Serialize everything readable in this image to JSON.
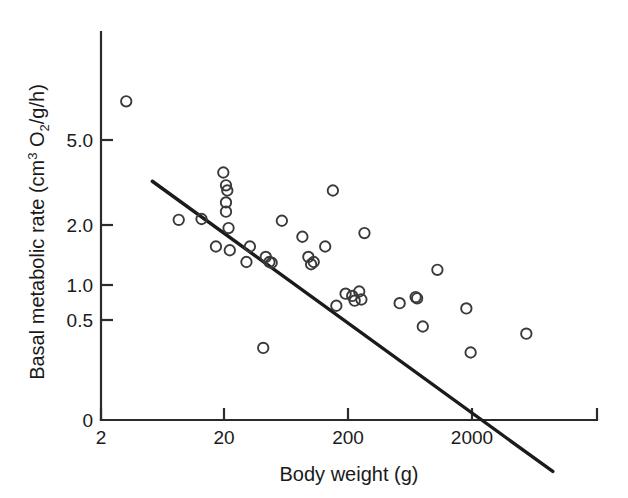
{
  "chart_data": {
    "type": "scatter",
    "title": "",
    "xlabel": "Body weight (g)",
    "ylabel_parts": {
      "prefix": "Basal metabolic rate (cm",
      "superscript": "3",
      "middle": " O",
      "subscript": "2",
      "suffix": "/g/h)"
    },
    "ylabel": "Basal metabolic rate (cm3 O2/g/h)",
    "xscale": "log",
    "yscale": "log",
    "xlim": [
      2,
      20000
    ],
    "ylim": [
      0.25,
      10
    ],
    "xticks": [
      2,
      20,
      200,
      2000
    ],
    "xtick_labels": [
      "2",
      "20",
      "200",
      "2000"
    ],
    "yticks": [
      5.0,
      2.0,
      1.0,
      0.5,
      0
    ],
    "ytick_labels": [
      "5.0",
      "2.0",
      "1.0",
      "0.5",
      "0"
    ],
    "grid": false,
    "legend": "none",
    "marker": "open-circle",
    "point_color": "#3a3a3a",
    "line_color": "#1b1b1b",
    "points": [
      {
        "x": 3.2,
        "y": 8.2
      },
      {
        "x": 8.5,
        "y": 1.8
      },
      {
        "x": 13.0,
        "y": 1.82
      },
      {
        "x": 19.5,
        "y": 3.3
      },
      {
        "x": 20.5,
        "y": 2.8
      },
      {
        "x": 21.0,
        "y": 2.62
      },
      {
        "x": 20.5,
        "y": 2.25
      },
      {
        "x": 20.5,
        "y": 2.0
      },
      {
        "x": 21.5,
        "y": 1.62
      },
      {
        "x": 17.0,
        "y": 1.28
      },
      {
        "x": 22.0,
        "y": 1.22
      },
      {
        "x": 32.0,
        "y": 1.28
      },
      {
        "x": 30.0,
        "y": 1.05
      },
      {
        "x": 43.0,
        "y": 1.12
      },
      {
        "x": 46.0,
        "y": 1.05
      },
      {
        "x": 48.0,
        "y": 1.04
      },
      {
        "x": 41.0,
        "y": 0.35
      },
      {
        "x": 58.0,
        "y": 1.78
      },
      {
        "x": 85.0,
        "y": 1.45
      },
      {
        "x": 95.0,
        "y": 1.12
      },
      {
        "x": 100.0,
        "y": 1.02
      },
      {
        "x": 105.0,
        "y": 1.05
      },
      {
        "x": 130.0,
        "y": 1.28
      },
      {
        "x": 150.0,
        "y": 2.62
      },
      {
        "x": 160.0,
        "y": 0.6
      },
      {
        "x": 190.0,
        "y": 0.7
      },
      {
        "x": 215.0,
        "y": 0.68
      },
      {
        "x": 225.0,
        "y": 0.64
      },
      {
        "x": 245.0,
        "y": 0.72
      },
      {
        "x": 255.0,
        "y": 0.65
      },
      {
        "x": 270.0,
        "y": 1.52
      },
      {
        "x": 520.0,
        "y": 0.62
      },
      {
        "x": 700.0,
        "y": 0.67
      },
      {
        "x": 720.0,
        "y": 0.66
      },
      {
        "x": 800.0,
        "y": 0.46
      },
      {
        "x": 1050.0,
        "y": 0.95
      },
      {
        "x": 1800.0,
        "y": 0.58
      },
      {
        "x": 1950.0,
        "y": 0.33
      },
      {
        "x": 5500.0,
        "y": 0.42
      }
    ],
    "fit_line": {
      "type": "linear-on-log-log",
      "x_start": 5.2,
      "y_start": 2.95,
      "x_end": 9000,
      "y_end": 0.072
    }
  }
}
